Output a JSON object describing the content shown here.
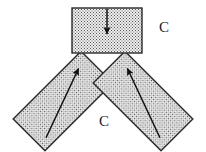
{
  "figure": {
    "title": "",
    "background_color": "#ffffff",
    "stroke_color": "#2b2b2b",
    "fill_pattern": "stipple-dots",
    "fill_base_color": "#eeeeee",
    "dot_color": "#4d4d4d",
    "arrow_color": "#111111"
  },
  "labels": {
    "c_right": "C",
    "c_center": "C"
  },
  "members": [
    {
      "name": "top-vertical-member",
      "shape": "rectangle",
      "angle_deg": 0,
      "arrow_direction": "down",
      "arrow_label": ""
    },
    {
      "name": "left-diagonal-member",
      "shape": "rectangle",
      "angle_deg": -45,
      "arrow_direction": "up-right",
      "arrow_label": ""
    },
    {
      "name": "right-diagonal-member",
      "shape": "rectangle",
      "angle_deg": 45,
      "arrow_direction": "up-left",
      "arrow_label": ""
    }
  ],
  "geometry": {
    "top_rect": {
      "x": 72,
      "y": 8,
      "width": 70,
      "height": 45
    },
    "left_bar": {
      "cx": 63,
      "cy": 101,
      "width": 96,
      "height": 45,
      "rotate": -45
    },
    "right_bar": {
      "cx": 143,
      "cy": 101,
      "width": 96,
      "height": 45,
      "rotate": 45
    },
    "label_c_right": {
      "x": 164,
      "y": 32
    },
    "label_c_center": {
      "x": 104,
      "y": 126
    }
  }
}
